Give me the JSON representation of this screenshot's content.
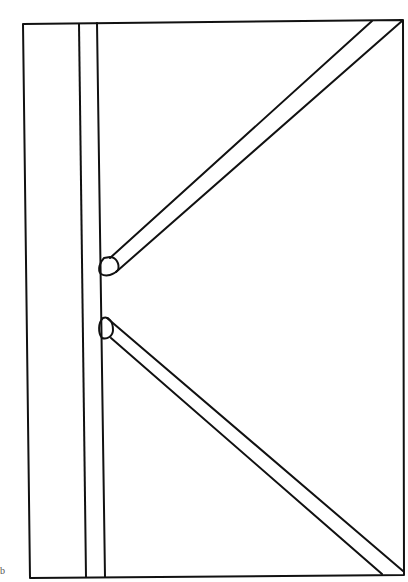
{
  "diagram": {
    "stroke_color": "#111111",
    "background": "#ffffff",
    "corner_mark": "b"
  }
}
